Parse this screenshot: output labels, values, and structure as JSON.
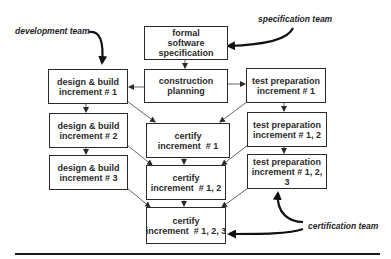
{
  "diagram": {
    "type": "process-flow",
    "teams": {
      "development": "development team",
      "specification": "specification team",
      "certification": "certification team"
    },
    "boxes": {
      "spec": [
        "formal",
        "software",
        "specification"
      ],
      "planning": [
        "construction",
        "planning"
      ],
      "dev1": [
        "design & build",
        "increment # 1"
      ],
      "dev2": [
        "design & build",
        "increment # 2"
      ],
      "dev3": [
        "design & build",
        "increment # 3"
      ],
      "cert1": [
        "certify",
        "increment  # 1"
      ],
      "cert2": [
        "certify",
        "increment  # 1, 2"
      ],
      "cert3": [
        "certify",
        "increment  # 1, 2, 3"
      ],
      "test1": [
        "test preparation",
        "increment # 1"
      ],
      "test2": [
        "test preparation",
        "increment # 1, 2"
      ],
      "test3": [
        "test preparation",
        "increment # 1, 2, 3"
      ]
    },
    "edges": [
      [
        "spec",
        "planning"
      ],
      [
        "planning",
        "dev1"
      ],
      [
        "planning",
        "test1"
      ],
      [
        "dev1",
        "dev2"
      ],
      [
        "dev2",
        "dev3"
      ],
      [
        "test1",
        "test2"
      ],
      [
        "test2",
        "test3"
      ],
      [
        "dev1",
        "cert1"
      ],
      [
        "test1",
        "cert1"
      ],
      [
        "cert1",
        "cert2"
      ],
      [
        "dev2",
        "cert2"
      ],
      [
        "test2",
        "cert2"
      ],
      [
        "cert2",
        "cert3"
      ],
      [
        "dev3",
        "cert3"
      ],
      [
        "test3",
        "cert3"
      ],
      [
        "development team",
        "dev1"
      ],
      [
        "specification team",
        "spec"
      ],
      [
        "certification team",
        "test3"
      ],
      [
        "certification team",
        "cert3"
      ]
    ]
  }
}
